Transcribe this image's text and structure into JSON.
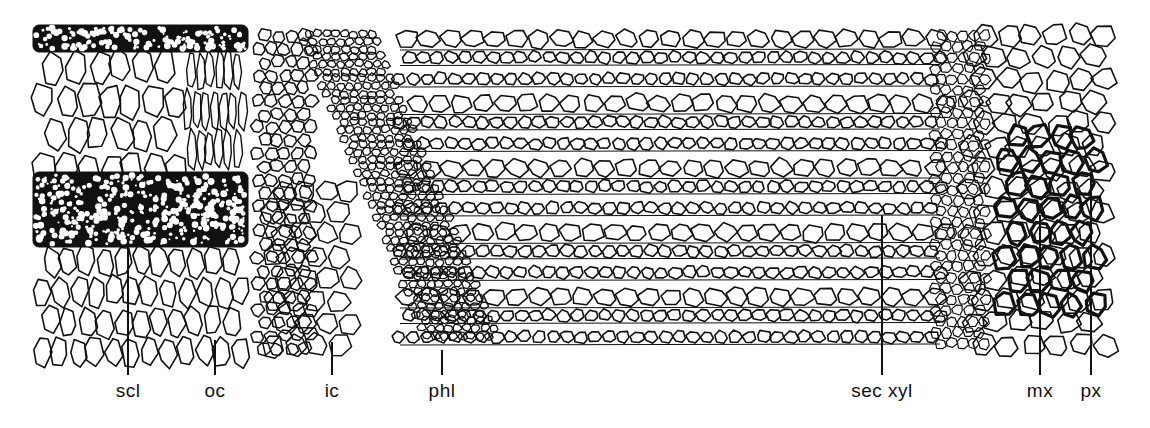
{
  "figure": {
    "ink_color": "#111111",
    "background_color": "#ffffff"
  },
  "labels": [
    {
      "id": "scl",
      "text": "scl",
      "meaning": "sclerenchyma",
      "x": 128,
      "line_top": 245,
      "line_bottom": 375
    },
    {
      "id": "oc",
      "text": "oc",
      "meaning": "outer cortex",
      "x": 215,
      "line_top": 340,
      "line_bottom": 375
    },
    {
      "id": "ic",
      "text": "ic",
      "meaning": "inner cortex",
      "x": 332,
      "line_top": 342,
      "line_bottom": 375
    },
    {
      "id": "phl",
      "text": "phl",
      "meaning": "phloem",
      "x": 442,
      "line_top": 350,
      "line_bottom": 375
    },
    {
      "id": "sec_xyl",
      "text": "sec xyl",
      "meaning": "secondary xylem",
      "x": 882,
      "line_top": 215,
      "line_bottom": 375
    },
    {
      "id": "mx",
      "text": "mx",
      "meaning": "metaxylem",
      "x": 1040,
      "line_top": 215,
      "line_bottom": 375
    },
    {
      "id": "px",
      "text": "px",
      "meaning": "protoxylem",
      "x": 1091,
      "line_top": 180,
      "line_bottom": 375
    }
  ],
  "regions": [
    {
      "id": "outer-cortex",
      "x": 33,
      "y": 25,
      "w": 215,
      "h": 330
    },
    {
      "id": "sclerenchyma-band-top",
      "x": 33,
      "y": 25,
      "w": 215,
      "h": 25
    },
    {
      "id": "sclerenchyma-band-middle",
      "x": 33,
      "y": 172,
      "w": 215,
      "h": 75
    },
    {
      "id": "inner-cortex",
      "x": 250,
      "y": 25,
      "w": 130,
      "h": 330
    },
    {
      "id": "phloem",
      "x": 300,
      "y": 25,
      "w": 175,
      "h": 330
    },
    {
      "id": "secondary-xylem",
      "x": 380,
      "y": 25,
      "w": 570,
      "h": 330
    },
    {
      "id": "metaxylem",
      "x": 990,
      "y": 120,
      "w": 115,
      "h": 200
    },
    {
      "id": "protoxylem",
      "x": 930,
      "y": 25,
      "w": 190,
      "h": 330
    }
  ]
}
